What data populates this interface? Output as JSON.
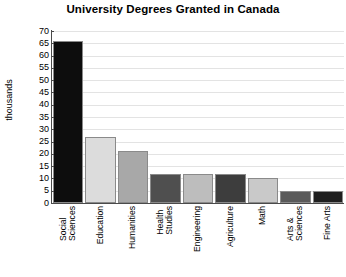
{
  "chart_data": {
    "type": "bar",
    "title": "University Degrees Granted in Canada",
    "xlabel": "",
    "ylabel": "thousands",
    "ylim": [
      0,
      70
    ],
    "ytick_step": 5,
    "yticks": [
      70,
      65,
      60,
      55,
      50,
      45,
      40,
      35,
      30,
      25,
      20,
      15,
      10,
      5,
      0
    ],
    "grid": true,
    "legend": "none",
    "categories": [
      "Social Sciences",
      "Education",
      "Humanities",
      "Health Studies",
      "Engineering",
      "Agriculture",
      "Math",
      "Arts & Sciences",
      "Fine Arts"
    ],
    "category_lines": [
      [
        "Social",
        "Sciences"
      ],
      [
        "Education",
        ""
      ],
      [
        "Humanities",
        ""
      ],
      [
        "Health",
        "Studies"
      ],
      [
        "Engineering",
        ""
      ],
      [
        "Agriculture",
        ""
      ],
      [
        "Math",
        ""
      ],
      [
        "Arts &",
        "Sciences"
      ],
      [
        "Fine Arts",
        ""
      ]
    ],
    "values": [
      66,
      27,
      21,
      12,
      12,
      12,
      10,
      5,
      5
    ],
    "bar_colors": [
      "#0d0d0d",
      "#dcdcdc",
      "#a8a8a8",
      "#4f4f4f",
      "#bdbdbd",
      "#3d3d3d",
      "#c9c9c9",
      "#5a5a5a",
      "#1f1f1f"
    ],
    "grid_color": "#e3e3e3",
    "axis_color": "#4a4a4a",
    "text_color": "#000000",
    "background": "#ffffff"
  }
}
